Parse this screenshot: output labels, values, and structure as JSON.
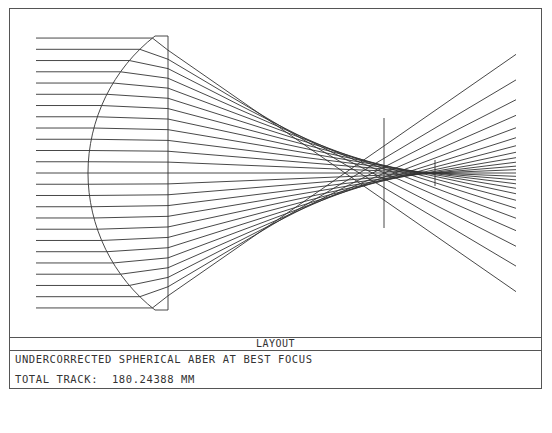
{
  "panel": {
    "title": "LAYOUT",
    "description": "UNDERCORRECTED SPHERICAL ABER AT BEST FOCUS",
    "total_track_label": "TOTAL TRACK:",
    "total_track_value": "180.24388 MM"
  },
  "diagram": {
    "type": "optical-layout-ray-trace",
    "element": "plano-convex lens (curved surface facing object)",
    "ray_count": 25,
    "ray_start_x": 36,
    "lens_curved_vertex_x": 88,
    "lens_flat_face_x": 168,
    "lens_top_y": 36,
    "lens_bottom_y": 310,
    "axis_y": 173,
    "image_end_x": 516,
    "best_focus_marker": {
      "x": 384,
      "y_top": 118,
      "y_bottom": 228
    },
    "paraxial_focus_marker": {
      "x": 435,
      "y_top": 160,
      "y_bottom": 186
    },
    "line_color": "#333333"
  }
}
